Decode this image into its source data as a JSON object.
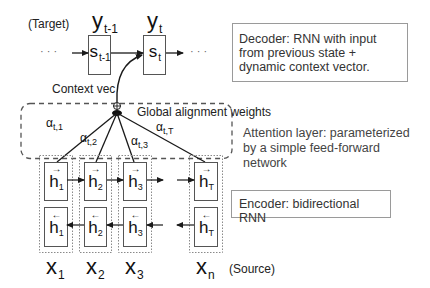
{
  "decoder": {
    "side_label": "(Target)",
    "outputs": [
      {
        "base": "y",
        "sub": "t-1"
      },
      {
        "base": "y",
        "sub": "t"
      }
    ],
    "states": [
      {
        "base": "s",
        "sub": "t-1"
      },
      {
        "base": "s",
        "sub": "t"
      }
    ],
    "ellipsis_left": "· · ·",
    "ellipsis_right": "· · ·",
    "note": "Decoder: RNN with input from previous state + dynamic context vector."
  },
  "context": {
    "label": "Context vec",
    "combine_symbol": "⊕"
  },
  "attention": {
    "title": "Global alignment weights",
    "note": "Attention layer: parameterized by a simple feed-forward network",
    "weights": [
      {
        "base": "α",
        "sub": "t,1"
      },
      {
        "base": "α",
        "sub": "t,2"
      },
      {
        "base": "α",
        "sub": "t,3"
      },
      {
        "base": "α",
        "sub": "t,T"
      }
    ]
  },
  "encoder": {
    "note": "Encoder: bidirectional RNN",
    "forward_states": [
      {
        "arrow": "→",
        "base": "h",
        "sub": "1"
      },
      {
        "arrow": "→",
        "base": "h",
        "sub": "2"
      },
      {
        "arrow": "→",
        "base": "h",
        "sub": "3"
      },
      {
        "arrow": "→",
        "base": "h",
        "sub": "T"
      }
    ],
    "backward_states": [
      {
        "arrow": "←",
        "base": "h",
        "sub": "1"
      },
      {
        "arrow": "←",
        "base": "h",
        "sub": "2"
      },
      {
        "arrow": "←",
        "base": "h",
        "sub": "3"
      },
      {
        "arrow": "←",
        "base": "h",
        "sub": "T"
      }
    ],
    "inputs": [
      {
        "base": "x",
        "sub": "1"
      },
      {
        "base": "x",
        "sub": "2"
      },
      {
        "base": "x",
        "sub": "3"
      },
      {
        "base": "x",
        "sub": "n"
      }
    ],
    "side_label": "(Source)"
  },
  "colors": {
    "line": "#1a1a1a",
    "box_border": "#555555",
    "dotted_border": "#8a8a8a",
    "note_border": "#9a9a9a"
  }
}
